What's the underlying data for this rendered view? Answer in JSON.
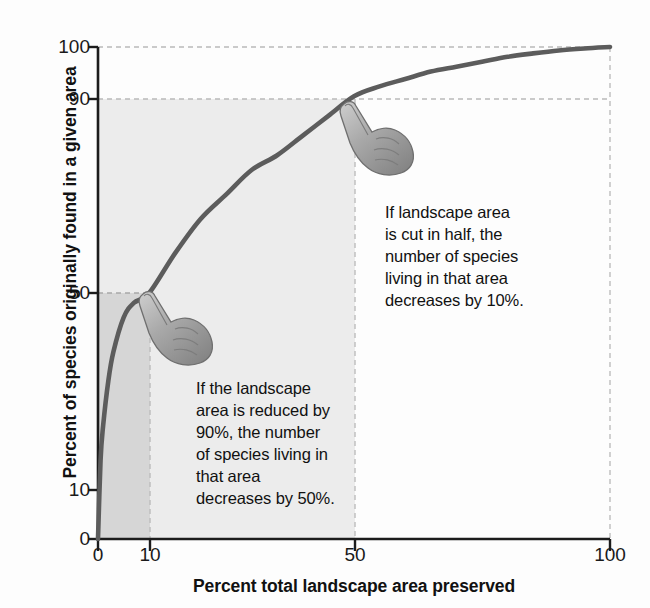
{
  "chart_data": {
    "type": "line",
    "title": "",
    "xlabel": "Percent total landscape area preserved",
    "ylabel": "Percent of species originally found in a given area",
    "xlim": [
      0,
      100
    ],
    "ylim": [
      0,
      100
    ],
    "xticks": [
      "0",
      "10",
      "50",
      "100"
    ],
    "xtick_values": [
      0,
      10,
      50,
      100
    ],
    "yticks": [
      "0",
      "10",
      "50",
      "90",
      "100"
    ],
    "ytick_values": [
      0,
      10,
      50,
      90,
      100
    ],
    "grid": "dashed reference lines at x=10, x=50, x=100, y=50, y=90, y=100",
    "legend": "none",
    "series": [
      {
        "name": "Species-area curve",
        "color": "#5c5c5c",
        "x": [
          0,
          0.5,
          1,
          2,
          3,
          5,
          7,
          10,
          15,
          20,
          25,
          30,
          35,
          40,
          45,
          50,
          55,
          60,
          65,
          70,
          75,
          80,
          85,
          90,
          95,
          100
        ],
        "y": [
          0,
          16,
          23,
          32,
          38,
          45,
          48,
          50,
          58,
          65,
          70,
          75,
          78,
          82,
          86,
          90,
          92,
          93.5,
          95,
          96,
          97,
          98,
          98.7,
          99.3,
          99.7,
          100
        ]
      }
    ],
    "key_points": [
      {
        "x": 10,
        "y": 50,
        "note": "10% area preserved → 50% of species remain"
      },
      {
        "x": 50,
        "y": 90,
        "note": "50% area preserved → 90% of species remain"
      },
      {
        "x": 100,
        "y": 100,
        "note": "100% area preserved → 100% of species remain"
      }
    ],
    "shaded_regions": [
      {
        "x_range": [
          0,
          10
        ],
        "y_range": [
          0,
          50
        ],
        "color": "#d6d6d6",
        "note": "dark band: 0-10% area, 0-50% species"
      },
      {
        "x_range": [
          0,
          50
        ],
        "y_range": [
          0,
          90
        ],
        "color": "#ececec",
        "note": "light band: 0-50% area, 0-90% species"
      }
    ]
  },
  "annotations": [
    {
      "id": "annot-0",
      "text": "If landscape area\nis cut in half, the\nnumber of species\nliving in that area\ndecreases by 10%.",
      "anchor_point": {
        "x": 50,
        "y": 90
      },
      "icon": "pointing-hand-icon"
    },
    {
      "id": "annot-1",
      "text": "If the landscape\narea is reduced by\n90%, the number\nof species living in\nthat area\ndecreases by 50%.",
      "anchor_point": {
        "x": 10,
        "y": 50
      },
      "icon": "pointing-hand-icon"
    }
  ],
  "colors": {
    "curve": "#5c5c5c",
    "axis": "#1c1c1c",
    "gridline": "#b5b5b5",
    "shade_dark": "#d6d6d6",
    "shade_light": "#ececec",
    "text": "#111111",
    "background": "#fdfdfd"
  }
}
